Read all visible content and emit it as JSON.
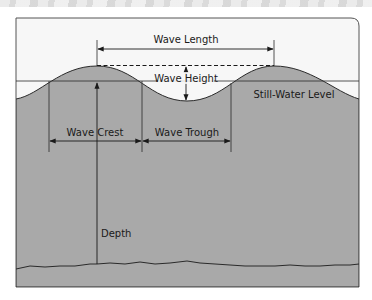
{
  "diagram": {
    "type": "wave-anatomy",
    "labels": {
      "wave_length": "Wave Length",
      "wave_height": "Wave Height",
      "still_water_level": "Still-Water Level",
      "wave_crest": "Wave Crest",
      "wave_trough": "Wave Trough",
      "depth": "Depth"
    },
    "colors": {
      "water": "#a9a9a9",
      "sky": "#f7f7f7",
      "line": "#2a2a2a",
      "frame": "#555555"
    }
  }
}
